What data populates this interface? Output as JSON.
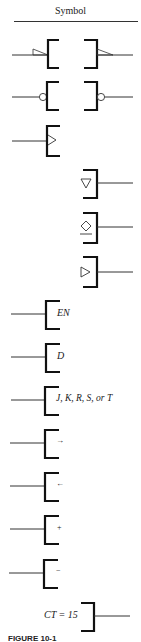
{
  "header": {
    "title": "Symbol"
  },
  "rows": [
    {
      "id": "polarity-indicator",
      "description": "polarity indicator triangles on input and output"
    },
    {
      "id": "negation-bubble",
      "description": "negation circles on input and output"
    },
    {
      "id": "dynamic-input",
      "description": "dynamic (edge-triggered) input indicator"
    },
    {
      "id": "open-collector",
      "symbol": "▽"
    },
    {
      "id": "three-state",
      "symbol": "◇"
    },
    {
      "id": "buffer-output",
      "symbol": "▷"
    },
    {
      "id": "enable",
      "label": "EN"
    },
    {
      "id": "data",
      "label": "D"
    },
    {
      "id": "jkrst",
      "label": "J, K, R, S, or T"
    },
    {
      "id": "shift-right",
      "label": "→"
    },
    {
      "id": "shift-left",
      "label": "←"
    },
    {
      "id": "count-up",
      "label": "+"
    },
    {
      "id": "count-down",
      "label": "−"
    },
    {
      "id": "content",
      "label": "CT = 15"
    }
  ],
  "caption": "FIGURE 10-1"
}
